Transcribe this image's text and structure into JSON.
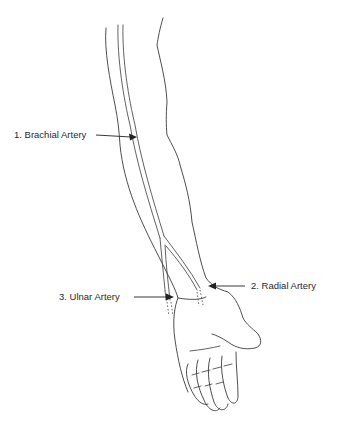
{
  "diagram": {
    "labels": [
      {
        "id": "brachial",
        "text": "1. Brachial Artery",
        "x": 14,
        "y": 130,
        "arrow": {
          "x1": 96,
          "y1": 135,
          "x2": 136,
          "y2": 137
        }
      },
      {
        "id": "radial",
        "text": "2. Radial Artery",
        "x": 251,
        "y": 283,
        "arrow": {
          "x1": 245,
          "y1": 286,
          "x2": 209,
          "y2": 286
        }
      },
      {
        "id": "ulnar",
        "text": "3. Ulnar Artery",
        "x": 59,
        "y": 292,
        "arrow": {
          "x1": 134,
          "y1": 297,
          "x2": 173,
          "y2": 297
        }
      }
    ],
    "colors": {
      "line": "#3a3a3a",
      "text": "#2a2a2a",
      "background": "#ffffff"
    }
  }
}
